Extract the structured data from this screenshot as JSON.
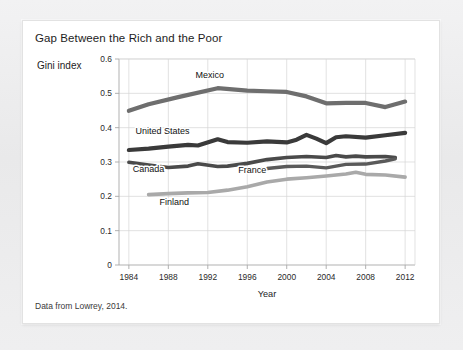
{
  "figure": {
    "title": "Gap Between the Rich and the Poor",
    "caption": "Data from Lowrey, 2014."
  },
  "chart_data": {
    "type": "line",
    "title": "Gap Between the Rich and the Poor",
    "xlabel": "Year",
    "ylabel": "Gini index",
    "xlim": [
      1983,
      2013
    ],
    "ylim": [
      0,
      0.6
    ],
    "xticks": [
      "1984",
      "1988",
      "1992",
      "1996",
      "2000",
      "2004",
      "2008",
      "2012"
    ],
    "xtick_values": [
      1984,
      1988,
      1992,
      1996,
      2000,
      2004,
      2008,
      2012
    ],
    "yticks": [
      "0",
      "0.1",
      "0.2",
      "0.3",
      "0.4",
      "0.5",
      "0.6"
    ],
    "ytick_values": [
      0,
      0.1,
      0.2,
      0.3,
      0.4,
      0.5,
      0.6
    ],
    "grid": true,
    "legend_position": "inline-labels",
    "series": [
      {
        "name": "Mexico",
        "color": "#6e6e6e",
        "width": 4.2,
        "label_x": 1992.2,
        "label_y": 0.545,
        "x": [
          1984,
          1986,
          1989,
          1993,
          1996,
          1998,
          2000,
          2002,
          2004,
          2006,
          2008,
          2010,
          2012
        ],
        "y": [
          0.449,
          0.468,
          0.489,
          0.515,
          0.508,
          0.506,
          0.504,
          0.491,
          0.471,
          0.472,
          0.472,
          0.46,
          0.476
        ]
      },
      {
        "name": "United States",
        "color": "#3a3a3a",
        "width": 4.2,
        "label_x": 1987.4,
        "label_y": 0.382,
        "x": [
          1984,
          1986,
          1988,
          1990,
          1991,
          1993,
          1994,
          1996,
          1998,
          2000,
          2001,
          2002,
          2003,
          2004,
          2005,
          2006,
          2008,
          2010,
          2012
        ],
        "y": [
          0.335,
          0.339,
          0.345,
          0.35,
          0.348,
          0.366,
          0.358,
          0.356,
          0.36,
          0.357,
          0.365,
          0.379,
          0.368,
          0.355,
          0.372,
          0.375,
          0.371,
          0.378,
          0.385
        ]
      },
      {
        "name": "Canada",
        "color": "#4a4a4a",
        "width": 3.6,
        "label_x": 1986.0,
        "label_y": 0.272,
        "x": [
          1984,
          1986,
          1988,
          1990,
          1991,
          1993,
          1994,
          1996,
          1998,
          2000,
          2002,
          2004,
          2005,
          2006,
          2007,
          2008,
          2010,
          2011
        ],
        "y": [
          0.299,
          0.291,
          0.284,
          0.288,
          0.295,
          0.287,
          0.288,
          0.296,
          0.307,
          0.313,
          0.316,
          0.313,
          0.319,
          0.315,
          0.317,
          0.315,
          0.316,
          0.313
        ]
      },
      {
        "name": "France",
        "color": "#5a5a5a",
        "width": 3.4,
        "label_x": 1996.5,
        "label_y": 0.268,
        "x": [
          1996,
          1998,
          2000,
          2002,
          2004,
          2005,
          2006,
          2008,
          2010,
          2011
        ],
        "y": [
          0.277,
          0.281,
          0.287,
          0.288,
          0.283,
          0.288,
          0.293,
          0.294,
          0.303,
          0.309
        ]
      },
      {
        "name": "Finland",
        "color": "#a9a9a9",
        "width": 3.6,
        "label_x": 1988.6,
        "label_y": 0.176,
        "x": [
          1986,
          1988,
          1990,
          1992,
          1994,
          1996,
          1998,
          2000,
          2002,
          2004,
          2006,
          2007,
          2008,
          2010,
          2012
        ],
        "y": [
          0.205,
          0.208,
          0.21,
          0.211,
          0.218,
          0.228,
          0.242,
          0.25,
          0.254,
          0.259,
          0.265,
          0.27,
          0.264,
          0.262,
          0.256
        ]
      }
    ]
  }
}
